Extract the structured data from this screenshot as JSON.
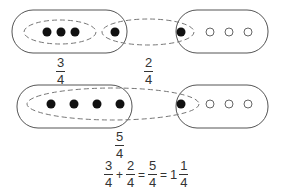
{
  "diagram": {
    "top_row": {
      "group_a": {
        "filled": 3,
        "total": 4
      },
      "group_b": {
        "filled": 1,
        "total": 4
      },
      "label_a": {
        "numerator": "3",
        "denominator": "4"
      },
      "label_b": {
        "numerator": "2",
        "denominator": "4"
      }
    },
    "bottom_row": {
      "group_a": {
        "filled": 4,
        "total": 4
      },
      "group_b": {
        "filled": 1,
        "total": 4
      },
      "label": {
        "numerator": "5",
        "denominator": "4"
      }
    },
    "equation": {
      "term1": {
        "numerator": "3",
        "denominator": "4"
      },
      "plus": "+",
      "term2": {
        "numerator": "2",
        "denominator": "4"
      },
      "equals1": "=",
      "sum": {
        "numerator": "5",
        "denominator": "4"
      },
      "equals2": "=",
      "mixed_whole": "1",
      "mixed_frac": {
        "numerator": "1",
        "denominator": "4"
      }
    },
    "colors": {
      "stroke": "#555555",
      "dot_fill": "#111111",
      "text": "#333333"
    }
  }
}
